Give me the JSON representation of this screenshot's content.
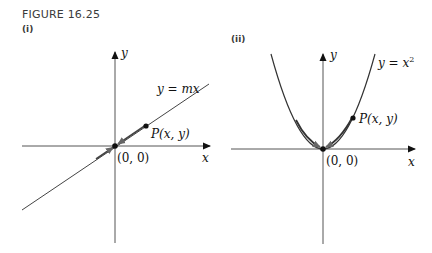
{
  "figure": {
    "caption": "FIGURE 16.25",
    "panels": [
      {
        "label": "(i)",
        "curve_label": "y = mx",
        "point_label": "P(x, y)",
        "origin_label": "(0, 0)",
        "x_axis_label": "x",
        "y_axis_label": "y"
      },
      {
        "label": "(ii)",
        "curve_label_base": "y = x",
        "curve_label_exp": "2",
        "point_label": "P(x, y)",
        "origin_label": "(0, 0)",
        "x_axis_label": "x",
        "y_axis_label": "y"
      }
    ]
  }
}
